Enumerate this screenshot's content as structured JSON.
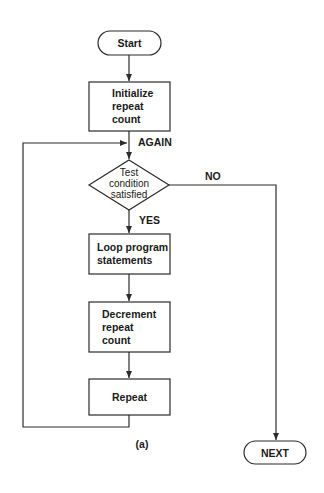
{
  "diagram": {
    "type": "flowchart",
    "caption": "(a)",
    "nodes": {
      "start": {
        "shape": "terminal",
        "text": "Start"
      },
      "init": {
        "shape": "process",
        "lines": [
          "Initialize",
          "repeat",
          "count"
        ]
      },
      "test": {
        "shape": "decision",
        "lines": [
          "Test",
          "condition",
          "satisfied"
        ]
      },
      "loop": {
        "shape": "process",
        "lines": [
          "Loop program",
          "statements"
        ]
      },
      "decrement": {
        "shape": "process",
        "lines": [
          "Decrement",
          "repeat",
          "count"
        ]
      },
      "repeat": {
        "shape": "process",
        "text": "Repeat"
      },
      "next": {
        "shape": "terminal",
        "text": "NEXT"
      }
    },
    "edge_labels": {
      "again": "AGAIN",
      "no": "NO",
      "yes": "YES"
    },
    "edges": [
      {
        "from": "start",
        "to": "init"
      },
      {
        "from": "init",
        "to": "test",
        "label": "AGAIN"
      },
      {
        "from": "test",
        "to": "next",
        "label": "NO"
      },
      {
        "from": "test",
        "to": "loop",
        "label": "YES"
      },
      {
        "from": "loop",
        "to": "decrement"
      },
      {
        "from": "decrement",
        "to": "repeat"
      },
      {
        "from": "repeat",
        "to": "test",
        "label": "AGAIN"
      }
    ],
    "colors": {
      "stroke": "#2b2b2b",
      "text": "#1a1a1a",
      "background": "#ffffff"
    }
  }
}
